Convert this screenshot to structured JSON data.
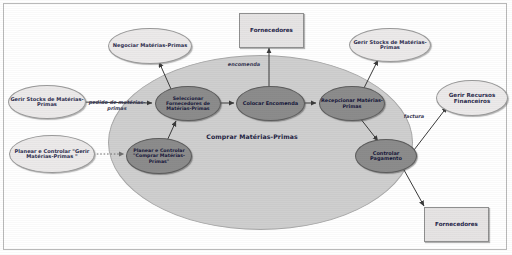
{
  "diagram": {
    "type": "business-process-diagram",
    "language": "pt",
    "container": {
      "label": "Comprar Matérias-Primas"
    },
    "inner_processes": [
      {
        "id": "seleccionar-fornecedores",
        "label": "Seleccionar Fornecedores de Matérias-Primas"
      },
      {
        "id": "colocar-encomenda",
        "label": "Colocar Encomenda"
      },
      {
        "id": "recepcionar-materias-primas",
        "label": "Recepcionar Matérias-Primas"
      },
      {
        "id": "controlar-pagamento",
        "label": "Controlar Pagamento"
      },
      {
        "id": "planear-controlar-comprar",
        "label": "Planear e Controlar \"Comprar Matérias-Primas\""
      }
    ],
    "external_processes": [
      {
        "id": "negociar-materias-primas",
        "label": "Negociar Matérias-Primas"
      },
      {
        "id": "gerir-stocks-esquerda",
        "label": "Gerir Stocks de Matérias-Primas"
      },
      {
        "id": "planear-controlar-gerir",
        "label": "Planear e Controlar \"Gerir Matérias-Primas \""
      },
      {
        "id": "gerir-stocks-direita",
        "label": "Gerir Stocks de Matérias-Primas"
      },
      {
        "id": "gerir-recursos-financeiros",
        "label": "Gerir Recursos Financeiros"
      }
    ],
    "external_entities": [
      {
        "id": "fornecedores-topo",
        "label": "Fornecedores"
      },
      {
        "id": "fornecedores-base",
        "label": "Fornecedores"
      }
    ],
    "flow_labels": [
      {
        "id": "pedido",
        "label": "pedido de matérias-primas"
      },
      {
        "id": "encomenda",
        "label": "encomenda"
      },
      {
        "id": "factura",
        "label": "factura"
      }
    ],
    "colors": {
      "container_fill": "#cfcfcf",
      "inner_fill": "#8c8c8c",
      "outer_fill": "#eceaea",
      "box_fill": "#e6e4e4",
      "text": "#1f1f44",
      "stroke": "#555555"
    }
  }
}
